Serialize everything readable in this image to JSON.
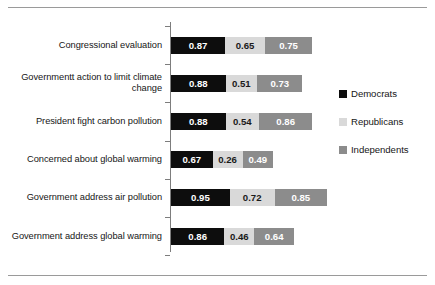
{
  "chart_data": {
    "type": "bar",
    "orientation": "horizontal",
    "stacked": true,
    "title": "",
    "subtitle": "",
    "xlabel": "",
    "ylabel": "",
    "grid": false,
    "legend_position": "right",
    "xlim": [
      0,
      2.5
    ],
    "categories": [
      "Congressional evaluation",
      "Governmentt action to limit climate change",
      "President fight carbon pollution",
      "Concerned about global warming",
      "Government address air pollution",
      "Government address global warming"
    ],
    "series": [
      {
        "name": "Democrats",
        "color": "#0d0d0d",
        "values": [
          0.87,
          0.88,
          0.88,
          0.67,
          0.95,
          0.86
        ],
        "labels": [
          "0.87",
          "0.88",
          "0.88",
          "0.67",
          "0.95",
          "0.86"
        ]
      },
      {
        "name": "Republicans",
        "color": "#d9d9d9",
        "values": [
          0.65,
          0.51,
          0.54,
          0.26,
          0.72,
          0.46
        ],
        "labels": [
          "0.65",
          "0.51",
          "0.54",
          "0.26",
          "0.72",
          "0.46"
        ]
      },
      {
        "name": "Independents",
        "color": "#8c8c8c",
        "values": [
          0.75,
          0.73,
          0.86,
          0.49,
          0.85,
          0.64
        ],
        "labels": [
          "0.75",
          "0.73",
          "0.86",
          "0.49",
          "0.85",
          "0.64"
        ]
      }
    ]
  },
  "legend": {
    "items": [
      {
        "label": "Democrats",
        "color": "#0d0d0d"
      },
      {
        "label": "Republicans",
        "color": "#d9d9d9"
      },
      {
        "label": "Independents",
        "color": "#8c8c8c"
      }
    ]
  },
  "frame": {
    "rule_color": "#9a9a9a",
    "axis_color": "#7d7d7d"
  }
}
